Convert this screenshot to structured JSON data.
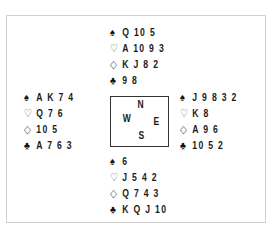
{
  "diagram": {
    "type": "bridge-deal",
    "suit_symbols": {
      "spades": "♠",
      "hearts": "♡",
      "diamonds": "◇",
      "clubs": "♣"
    },
    "compass": {
      "north": "N",
      "west": "W",
      "east": "E",
      "south": "S"
    },
    "hands": {
      "north": {
        "spades": "Q 10 5",
        "hearts": "A 10 9 3",
        "diamonds": "K J 8 2",
        "clubs": "9 8"
      },
      "west": {
        "spades": "A K 7 4",
        "hearts": "Q 7 6",
        "diamonds": "10 5",
        "clubs": "A 7 6 3"
      },
      "east": {
        "spades": "J 9 8 3 2",
        "hearts": "K 8",
        "diamonds": "A 9 6",
        "clubs": "10 5 2"
      },
      "south": {
        "spades": "6",
        "hearts": "J 5 4 2",
        "diamonds": "Q 7 4 3",
        "clubs": "K Q J 10"
      }
    },
    "colors": {
      "frame_border": "#cfcfcf",
      "compass_border": "#333333",
      "text": "#1a1a1a"
    }
  }
}
